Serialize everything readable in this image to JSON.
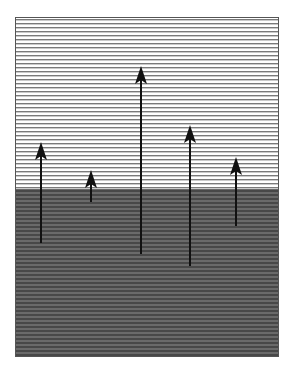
{
  "figure": {
    "colors": {
      "background": "#ffffff",
      "upper_region_fill": "#ffffff",
      "upper_region_lines": "#7a7a7a",
      "lower_region_fill": "#6a6a6a",
      "lower_region_lines": "#484848",
      "frame": "#555555",
      "arrow": "#111111"
    },
    "regions": [
      {
        "name": "upper-region",
        "pattern": "horizontal-lines",
        "shade": "light"
      },
      {
        "name": "lower-region",
        "pattern": "horizontal-lines",
        "shade": "dark"
      }
    ],
    "arrows": [
      {
        "name": "arrow-1",
        "direction": "up"
      },
      {
        "name": "arrow-2",
        "direction": "up"
      },
      {
        "name": "arrow-3",
        "direction": "up"
      },
      {
        "name": "arrow-4",
        "direction": "up"
      },
      {
        "name": "arrow-5",
        "direction": "up"
      }
    ]
  }
}
